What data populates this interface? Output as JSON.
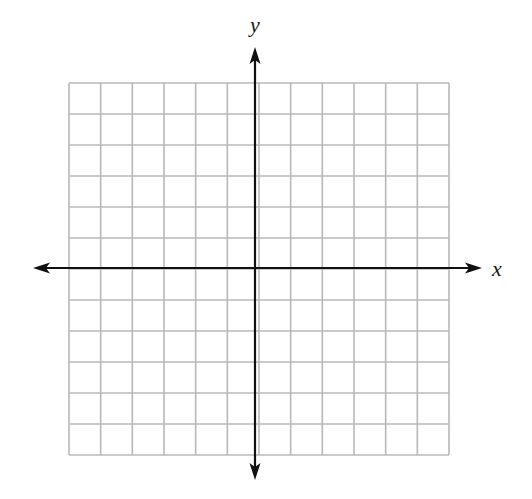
{
  "diagram": {
    "type": "coordinate-grid",
    "x_axis_label": "x",
    "y_axis_label": "y",
    "grid": {
      "columns": 12,
      "rows": 12,
      "left": 69,
      "top": 83,
      "right": 449,
      "bottom": 455,
      "line_color": "#b8b8b8"
    },
    "axes": {
      "color": "#111111",
      "origin_x": 255,
      "origin_y": 268,
      "x_start": 33,
      "x_end": 482,
      "y_start": 47,
      "y_end": 480
    }
  }
}
